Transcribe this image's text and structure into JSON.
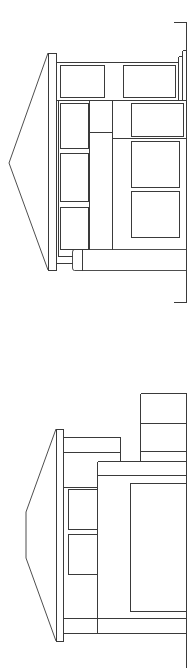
{
  "drawing": {
    "type": "architectural-elevations",
    "orientation": "rotated-90",
    "line_color": "#3a3a3a",
    "background": "#ffffff",
    "elevations": [
      {
        "name": "upper-elevation",
        "roof": {
          "type": "gable",
          "apex": [
            9,
            163
          ],
          "eave_top": [
            48,
            53
          ],
          "eave_bottom": [
            48,
            270
          ],
          "eave_board": {
            "x": 48,
            "y": 53,
            "w": 8,
            "h": 217
          }
        },
        "walls": {
          "top_line_y": 62,
          "mid_line_y": 100,
          "right_x": 186
        },
        "windows": [
          {
            "x": 60,
            "y": 65,
            "w": 44,
            "h": 32
          },
          {
            "x": 123,
            "y": 65,
            "w": 52,
            "h": 32
          },
          {
            "x": 60,
            "y": 103,
            "w": 28,
            "h": 45
          },
          {
            "x": 60,
            "y": 153,
            "w": 28,
            "h": 48
          },
          {
            "x": 60,
            "y": 207,
            "w": 28,
            "h": 42
          },
          {
            "x": 131,
            "y": 103,
            "w": 52,
            "h": 33
          },
          {
            "x": 131,
            "y": 141,
            "w": 48,
            "h": 46
          },
          {
            "x": 131,
            "y": 191,
            "w": 48,
            "h": 46
          }
        ],
        "base_block": {
          "x": 72,
          "y": 249,
          "w": 114,
          "h": 21,
          "inner_x": 82
        },
        "bracket": {
          "top_y": 22,
          "bottom_y": 302,
          "x": 186,
          "tick_left_x": 173
        }
      },
      {
        "name": "lower-elevation",
        "roof": {
          "type": "hip",
          "points": [
            [
              56,
              429
            ],
            [
              26,
              512
            ],
            [
              26,
              558
            ],
            [
              56,
              641
            ]
          ],
          "eave_board": {
            "x": 56,
            "y": 429,
            "w": 7,
            "h": 212
          }
        },
        "stack_block": {
          "x": 140,
          "y": 393,
          "w": 46,
          "h": 68,
          "lines_y": [
            423,
            451
          ]
        },
        "upper_block": {
          "x": 63,
          "y": 437,
          "w": 57,
          "h": 15
        },
        "main_block": {
          "x": 97,
          "y": 461,
          "w": 89,
          "h": 172,
          "line_y": 475
        },
        "windows": [
          {
            "x": 68,
            "y": 489,
            "w": 29,
            "h": 40
          },
          {
            "x": 68,
            "y": 534,
            "w": 29,
            "h": 40
          },
          {
            "x": 130,
            "y": 483,
            "w": 56,
            "h": 128
          }
        ],
        "base_lines_y": [
          618,
          633
        ],
        "right_x": 186
      }
    ]
  }
}
